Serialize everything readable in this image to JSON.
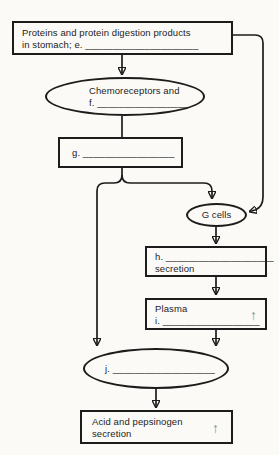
{
  "diagram": {
    "colors": {
      "background": "#fbfaf7",
      "line": "#1c1c1c",
      "gray_arrow": "#8c8c8c"
    },
    "nodes": {
      "proteins_box": {
        "line1": "Proteins and protein digestion products",
        "line2": "in stomach; e. _____________________"
      },
      "chemoreceptors_ellipse": {
        "line1": "Chemoreceptors and",
        "line2": "f. _________________"
      },
      "g_box": {
        "label": "g. _________________"
      },
      "g_cells_ellipse": {
        "label": "G cells"
      },
      "h_box": {
        "line1": "h. ____________________",
        "line2": "secretion"
      },
      "plasma_box": {
        "line1": "Plasma",
        "line2": "i. __________________",
        "up_arrow": "↑"
      },
      "j_ellipse": {
        "label": "j. ___________________"
      },
      "acid_box": {
        "line1": "Acid and pepsinogen",
        "line2": "secretion",
        "up_arrow": "↑"
      }
    }
  }
}
